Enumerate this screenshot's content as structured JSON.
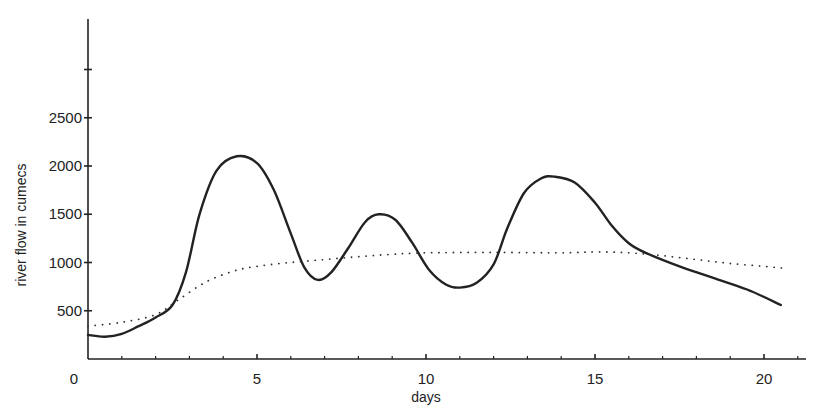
{
  "chart_data": {
    "type": "line",
    "title": "",
    "xlabel": "days",
    "ylabel": "river flow in cumecs",
    "xlim": [
      0,
      21.5
    ],
    "ylim": [
      0,
      3500
    ],
    "x_ticks": [
      0,
      5,
      10,
      15,
      20
    ],
    "x_tick_labels": [
      "0",
      "5",
      "10",
      "15",
      "20"
    ],
    "x_minor_tick_step": 1,
    "y_ticks": [
      500,
      1000,
      1500,
      2000,
      2500,
      3000
    ],
    "y_tick_labels": [
      "500",
      "1000",
      "1500",
      "2000",
      "2500",
      ""
    ],
    "grid": false,
    "legend": null,
    "series": [
      {
        "name": "river flow (solid)",
        "style": "solid",
        "color": "#222222",
        "x": [
          0,
          0.5,
          1,
          1.5,
          2,
          2.5,
          2.9,
          3.3,
          3.8,
          4.4,
          5,
          5.5,
          6,
          6.4,
          6.8,
          7.2,
          7.7,
          8.2,
          8.6,
          9.1,
          9.6,
          10.1,
          10.6,
          11,
          11.5,
          12,
          12.4,
          12.9,
          13.4,
          13.8,
          14.4,
          15,
          15.5,
          16,
          16.5,
          17.5,
          18.5,
          19.5,
          20.5
        ],
        "values": [
          250,
          230,
          260,
          340,
          430,
          560,
          900,
          1500,
          1950,
          2100,
          2030,
          1750,
          1300,
          950,
          820,
          900,
          1150,
          1420,
          1500,
          1440,
          1200,
          920,
          770,
          740,
          790,
          980,
          1350,
          1720,
          1870,
          1890,
          1830,
          1620,
          1380,
          1200,
          1100,
          960,
          840,
          720,
          560
        ]
      },
      {
        "name": "average flow (dotted)",
        "style": "dotted",
        "color": "#333333",
        "x": [
          0,
          1,
          2,
          2.7,
          3.5,
          4.3,
          5,
          6,
          7,
          8,
          9,
          10,
          12,
          14,
          15,
          16,
          17,
          18,
          19,
          20,
          20.6
        ],
        "values": [
          340,
          380,
          460,
          620,
          800,
          910,
          960,
          1000,
          1030,
          1060,
          1085,
          1100,
          1105,
          1100,
          1110,
          1100,
          1070,
          1030,
          990,
          960,
          940
        ]
      }
    ]
  },
  "axes": {
    "xlabel": "days",
    "ylabel": "river flow in cumecs",
    "origin_label": "0"
  }
}
